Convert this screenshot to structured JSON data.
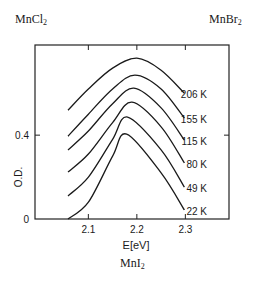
{
  "panels": {
    "top_left": {
      "base": "MnCl",
      "sub": "2"
    },
    "top_right": {
      "base": "MnBr",
      "sub": "2"
    },
    "bottom": {
      "base": "MnI",
      "sub": "2"
    }
  },
  "chart_data": {
    "type": "line",
    "title": "MnI2",
    "xlabel": "E[eV]",
    "ylabel": "O.D.",
    "xlim": [
      1.99,
      2.39
    ],
    "ylim": [
      0,
      0.83
    ],
    "xticks": [
      2.1,
      2.2,
      2.3
    ],
    "xtick_labels": [
      "2.1",
      "2.2",
      "2.3"
    ],
    "yticks": [
      0,
      0.4
    ],
    "ytick_labels": [
      "0",
      "0.4"
    ],
    "grid": false,
    "legend": "inline labels at right end of each curve",
    "series": [
      {
        "name": "206 K",
        "x": [
          2.058,
          2.1,
          2.15,
          2.2,
          2.25,
          2.298
        ],
        "y": [
          0.519,
          0.62,
          0.72,
          0.767,
          0.71,
          0.6
        ]
      },
      {
        "name": "155 K",
        "x": [
          2.058,
          2.1,
          2.15,
          2.196,
          2.25,
          2.298
        ],
        "y": [
          0.395,
          0.5,
          0.62,
          0.686,
          0.62,
          0.481
        ]
      },
      {
        "name": "115 K",
        "x": [
          2.058,
          2.1,
          2.15,
          2.194,
          2.25,
          2.298
        ],
        "y": [
          0.329,
          0.42,
          0.55,
          0.624,
          0.53,
          0.376
        ]
      },
      {
        "name": "80 K",
        "x": [
          2.058,
          2.1,
          2.15,
          2.19,
          2.25,
          2.298
        ],
        "y": [
          0.224,
          0.31,
          0.46,
          0.557,
          0.44,
          0.267
        ]
      },
      {
        "name": "49 K",
        "x": [
          2.058,
          2.1,
          2.15,
          2.181,
          2.25,
          2.298
        ],
        "y": [
          0.11,
          0.2,
          0.38,
          0.486,
          0.33,
          0.152
        ]
      },
      {
        "name": "22 K",
        "x": [
          2.058,
          2.1,
          2.15,
          2.179,
          2.25,
          2.298
        ],
        "y": [
          0.0,
          0.08,
          0.3,
          0.405,
          0.22,
          0.043
        ]
      }
    ]
  }
}
